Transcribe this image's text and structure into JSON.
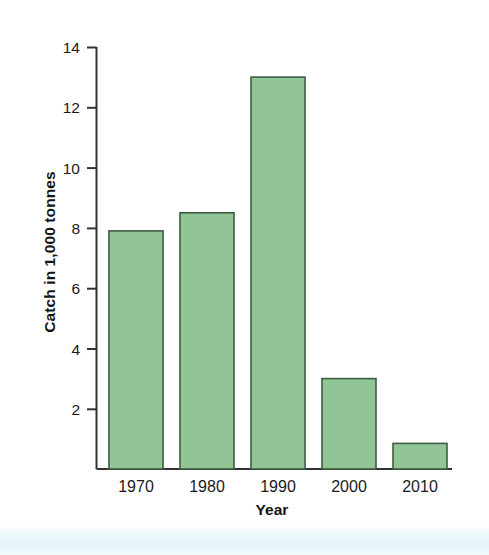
{
  "chart_data": {
    "type": "bar",
    "title": "",
    "subtitle": "",
    "xlabel": "Year",
    "ylabel": "Catch in 1,000 tonnes",
    "categories": [
      "1970",
      "1980",
      "1990",
      "2000",
      "2010"
    ],
    "values": [
      7.9,
      8.5,
      13.0,
      3.0,
      0.85
    ],
    "series": [
      {
        "name": "Catch",
        "values": [
          7.9,
          8.5,
          13.0,
          3.0,
          0.85
        ]
      }
    ],
    "ylim": [
      0,
      14
    ],
    "yticks": [
      2,
      4,
      6,
      8,
      10,
      12,
      14
    ],
    "ytick_labels": [
      "2",
      "4",
      "6",
      "8",
      "10",
      "12",
      "14"
    ],
    "xtick_labels": [
      "1970",
      "1980",
      "1990",
      "2000",
      "2010"
    ],
    "grid": false,
    "legend": false,
    "legend_position": "none",
    "annotations": []
  },
  "style": {
    "bar_fill": "#92c596",
    "bar_stroke": "#3d5c42",
    "axis_color": "#333333",
    "text_color": "#1a1a1a",
    "background": "#ffffff",
    "band_color": "#e6f5fa"
  }
}
